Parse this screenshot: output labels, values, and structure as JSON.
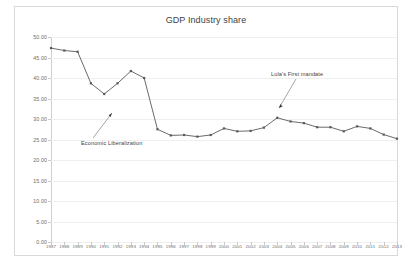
{
  "chart": {
    "title": "GDP Industry share",
    "frame_color": "#d9d9d9",
    "series_color": "#595959",
    "grid_color": "#efefef"
  },
  "annotations": [
    {
      "label": "Economic Liberalization",
      "points_to_year": "1991",
      "points_to_value": 31.7
    },
    {
      "label": "Lula's First mandate",
      "points_to_year": "2003",
      "points_to_value": 30.3
    }
  ],
  "chart_data": {
    "type": "line",
    "title": "GDP Industry share",
    "xlabel": "",
    "ylabel": "",
    "ylim": [
      0,
      50
    ],
    "ytick_step": 5,
    "ytick_labels": [
      "0.00",
      "5.00",
      "10.00",
      "15.00",
      "20.00",
      "25.00",
      "30.00",
      "35.00",
      "40.00",
      "45.00",
      "50.00"
    ],
    "grid": true,
    "legend": "none",
    "marker": "square",
    "categories": [
      "1987",
      "1988",
      "1989",
      "1990",
      "1991",
      "1992",
      "1993",
      "1994",
      "1995",
      "1996",
      "1997",
      "1998",
      "1999",
      "2000",
      "2001",
      "2002",
      "2003",
      "2004",
      "2005",
      "2006",
      "2007",
      "2008",
      "2009",
      "2010",
      "2011",
      "2012",
      "2013"
    ],
    "values": [
      47.3,
      46.7,
      46.4,
      38.7,
      36.1,
      38.7,
      41.7,
      40.0,
      27.5,
      26.0,
      26.1,
      25.7,
      26.1,
      27.7,
      27.0,
      27.1,
      27.9,
      30.3,
      29.4,
      29.0,
      28.0,
      28.0,
      27.0,
      28.2,
      27.7,
      26.2,
      25.2
    ]
  }
}
